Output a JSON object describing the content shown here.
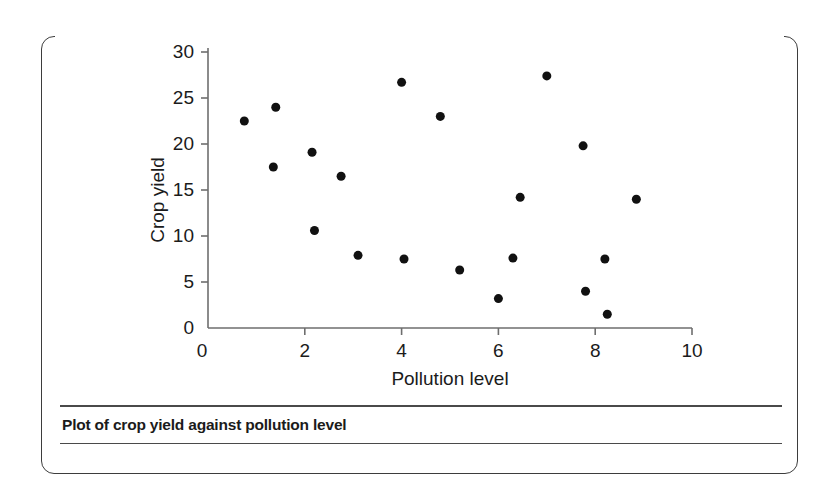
{
  "figure": {
    "caption": "Plot of crop yield against pollution level"
  },
  "chart_data": {
    "type": "scatter",
    "title": "",
    "xlabel": "Pollution level",
    "ylabel": "Crop yield",
    "xlim": [
      0,
      10
    ],
    "ylim": [
      0,
      30
    ],
    "xticks": [
      "0",
      "2",
      "4",
      "6",
      "8",
      "10"
    ],
    "xtick_values": [
      0,
      2,
      4,
      6,
      8,
      10
    ],
    "yticks": [
      "0",
      "5",
      "10",
      "15",
      "20",
      "25",
      "30"
    ],
    "ytick_values": [
      0,
      5,
      10,
      15,
      20,
      25,
      30
    ],
    "grid": false,
    "legend": false,
    "marker": {
      "shape": "circle",
      "color": "#111111",
      "size": 9
    },
    "series": [
      {
        "name": "Crop yield vs pollution level",
        "points": [
          {
            "x": 0.75,
            "y": 22.5
          },
          {
            "x": 1.35,
            "y": 17.5
          },
          {
            "x": 1.4,
            "y": 24.0
          },
          {
            "x": 2.15,
            "y": 19.1
          },
          {
            "x": 2.2,
            "y": 10.6
          },
          {
            "x": 2.75,
            "y": 16.5
          },
          {
            "x": 3.1,
            "y": 7.9
          },
          {
            "x": 4.0,
            "y": 26.7
          },
          {
            "x": 4.05,
            "y": 7.5
          },
          {
            "x": 4.8,
            "y": 23.0
          },
          {
            "x": 5.2,
            "y": 6.3
          },
          {
            "x": 6.0,
            "y": 3.2
          },
          {
            "x": 6.3,
            "y": 7.6
          },
          {
            "x": 6.45,
            "y": 14.2
          },
          {
            "x": 7.0,
            "y": 27.4
          },
          {
            "x": 7.75,
            "y": 19.8
          },
          {
            "x": 7.8,
            "y": 4.0
          },
          {
            "x": 8.2,
            "y": 7.5
          },
          {
            "x": 8.25,
            "y": 1.5
          },
          {
            "x": 8.85,
            "y": 14.0
          }
        ]
      }
    ],
    "axis_color": "#6e6e6e",
    "text_color": "#1b1b1b"
  }
}
